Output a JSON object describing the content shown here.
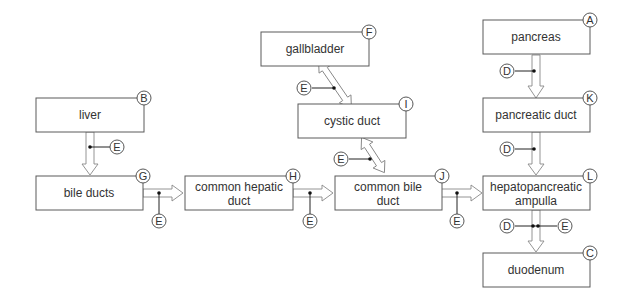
{
  "nodes": {
    "liver": {
      "label": "liver",
      "badge": "B"
    },
    "bile_ducts": {
      "label": "bile ducts",
      "badge": "G"
    },
    "common_hepatic_duct": {
      "label_lines": [
        "common hepatic",
        "duct"
      ],
      "badge": "H"
    },
    "gallbladder": {
      "label": "gallbladder",
      "badge": "F"
    },
    "cystic_duct": {
      "label": "cystic duct",
      "badge": "I"
    },
    "common_bile_duct": {
      "label_lines": [
        "common bile",
        "duct"
      ],
      "badge": "J"
    },
    "pancreas": {
      "label": "pancreas",
      "badge": "A"
    },
    "pancreatic_duct": {
      "label": "pancreatic duct",
      "badge": "K"
    },
    "hepatopancreatic_ampulla": {
      "label_lines": [
        "hepatopancreatic",
        "ampulla"
      ],
      "badge": "L"
    },
    "duodenum": {
      "label": "duodenum",
      "badge": "C"
    }
  },
  "controls": {
    "E": "E",
    "D": "D"
  },
  "edges": [
    {
      "from": "liver",
      "to": "bile_ducts",
      "controls": [
        "E"
      ]
    },
    {
      "from": "bile_ducts",
      "to": "common_hepatic_duct",
      "controls": [
        "E"
      ]
    },
    {
      "from": "common_hepatic_duct",
      "to": "common_bile_duct",
      "controls": [
        "E"
      ]
    },
    {
      "from": "gallbladder",
      "to": "cystic_duct",
      "bidirectional": true,
      "controls": [
        "E"
      ]
    },
    {
      "from": "cystic_duct",
      "to": "common_bile_duct",
      "bidirectional": true,
      "controls": [
        "E"
      ]
    },
    {
      "from": "common_bile_duct",
      "to": "hepatopancreatic_ampulla",
      "controls": [
        "E"
      ]
    },
    {
      "from": "pancreas",
      "to": "pancreatic_duct",
      "controls": [
        "D"
      ]
    },
    {
      "from": "pancreatic_duct",
      "to": "hepatopancreatic_ampulla",
      "controls": [
        "D"
      ]
    },
    {
      "from": "hepatopancreatic_ampulla",
      "to": "duodenum",
      "controls": [
        "D",
        "E"
      ]
    }
  ]
}
